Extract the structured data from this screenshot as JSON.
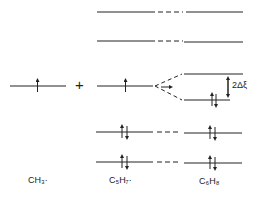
{
  "diagram": {
    "type": "molecular orbital energy level diagram",
    "species": [
      {
        "label": "CH₃·",
        "key": "ch3"
      },
      {
        "label": "C₅H₇·",
        "key": "c5h7"
      },
      {
        "label": "C₆H₈",
        "key": "c6h8"
      }
    ],
    "plus_sign": "+",
    "splitting_label": "2Δξ",
    "colors": {
      "line": "#222222"
    }
  }
}
